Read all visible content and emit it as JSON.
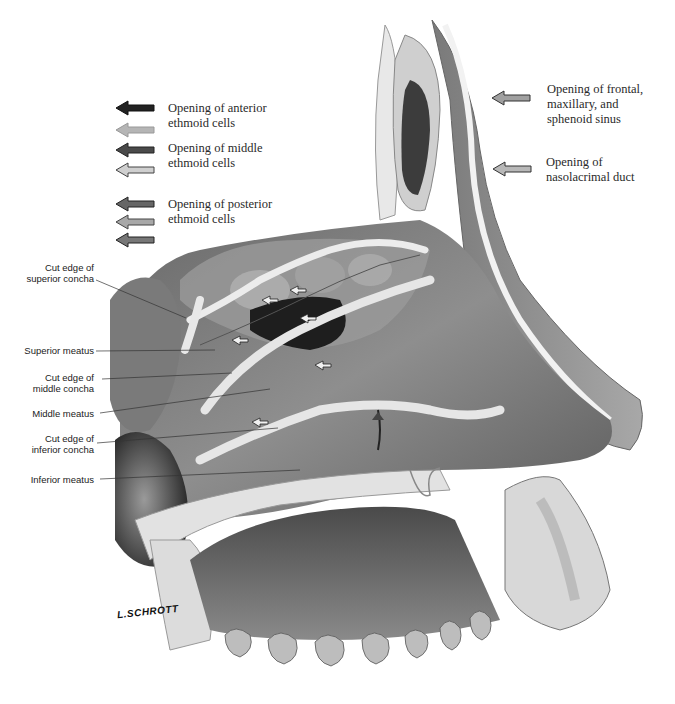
{
  "figure": {
    "type": "anatomical-illustration",
    "signature": "L.SCHROTT",
    "caption_visible": "cropped / illegible"
  },
  "legend": {
    "left": [
      {
        "label": "Opening of anterior\nethmoid cells",
        "arrows": [
          {
            "shade": "#222222"
          },
          {
            "shade": "#b5b5b5"
          }
        ]
      },
      {
        "label": "Opening of middle\nethmoid cells",
        "arrows": [
          {
            "shade": "#4a4a4a"
          },
          {
            "shade": "#cfcfcf"
          }
        ]
      },
      {
        "label": "Opening of posterior\nethmoid cells",
        "arrows": [
          {
            "shade": "#666666"
          },
          {
            "shade": "#a8a8a8"
          },
          {
            "shade": "#777777"
          }
        ]
      }
    ],
    "right": [
      {
        "label": "Opening of frontal,\nmaxillary, and\nsphenoid sinus",
        "arrow_shade": "#a0a0a0"
      },
      {
        "label": "Opening of\nnasolacrimal duct",
        "arrow_shade": "#b8b8b8"
      }
    ]
  },
  "labels": [
    {
      "text": "Cut edge of\nsuperior concha"
    },
    {
      "text": "Superior  meatus"
    },
    {
      "text": "Cut edge of\nmiddle concha"
    },
    {
      "text": "Middle meatus"
    },
    {
      "text": "Cut edge of\ninferior concha"
    },
    {
      "text": "Inferior meatus"
    }
  ],
  "colors": {
    "background": "#ffffff",
    "tissue_dark": "#3a3a3a",
    "tissue_mid": "#8a8a8a",
    "tissue_light": "#c8c8c8",
    "bone_edge": "#eeeeee",
    "leader_line": "#333333"
  }
}
